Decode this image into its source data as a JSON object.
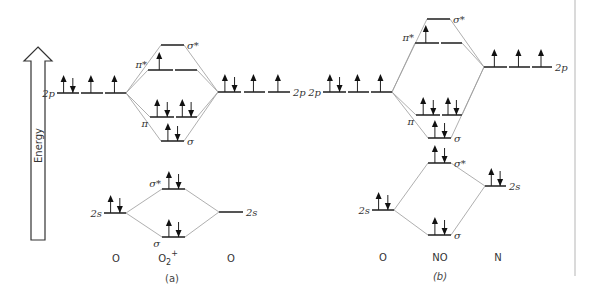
{
  "energy_axis": {
    "label": "Energy",
    "arrow": {
      "x": 38,
      "top": 47,
      "bottom": 240,
      "shaft_half": 7,
      "head_half": 14,
      "head_h": 14
    }
  },
  "divider": {
    "x": 575,
    "y1": 0,
    "y2": 276
  },
  "panels": [
    {
      "id": "a",
      "caption": "(a)",
      "caption_pos": [
        172,
        282
      ],
      "species": [
        {
          "text": "O",
          "x": 116,
          "y": 262
        },
        {
          "text": "O",
          "sub": "2",
          "sup": "+",
          "x": 168,
          "y": 262
        },
        {
          "text": "O",
          "x": 231,
          "y": 262
        }
      ],
      "levels": [
        {
          "name": "left-2p",
          "segments": [
            [
              57,
              79
            ],
            [
              81,
              103
            ],
            [
              105,
              126
            ]
          ],
          "y": 93,
          "electrons": [
            [
              "up",
              "down"
            ],
            [
              "up"
            ],
            [
              "up"
            ]
          ],
          "label": "2p",
          "label_side": "left"
        },
        {
          "name": "right-2p",
          "segments": [
            [
              218,
              241
            ],
            [
              244,
              265
            ],
            [
              268,
              290
            ]
          ],
          "y": 92,
          "electrons": [
            [
              "up",
              "down"
            ],
            [
              "up"
            ],
            [
              "up"
            ]
          ],
          "label": "2p",
          "label_side": "right"
        },
        {
          "name": "sigma-star-2p",
          "segments": [
            [
              161,
              184
            ]
          ],
          "y": 45,
          "electrons": [
            []
          ],
          "label": "σ*",
          "label_side": "right"
        },
        {
          "name": "pi-star-2p",
          "segments": [
            [
              148,
              173
            ],
            [
              175,
              197
            ]
          ],
          "y": 70,
          "electrons": [
            [
              "up"
            ],
            []
          ],
          "label": "π*",
          "label_side": "left-above"
        },
        {
          "name": "pi-2p",
          "segments": [
            [
              150,
              174
            ],
            [
              176,
              197
            ]
          ],
          "y": 117,
          "electrons": [
            [
              "up",
              "down"
            ],
            [
              "up",
              "down"
            ]
          ],
          "label": "π",
          "label_side": "left-below"
        },
        {
          "name": "sigma-2p",
          "segments": [
            [
              161,
              184
            ]
          ],
          "y": 141,
          "electrons": [
            [
              "up",
              "down"
            ]
          ],
          "label": "σ",
          "label_side": "right"
        },
        {
          "name": "left-2s",
          "segments": [
            [
              104,
              126
            ]
          ],
          "y": 213,
          "electrons": [
            [
              "up",
              "down"
            ]
          ],
          "label": "2s",
          "label_side": "left"
        },
        {
          "name": "right-2s",
          "segments": [
            [
              219,
              243
            ]
          ],
          "y": 212,
          "electrons": [
            []
          ],
          "label": "2s",
          "label_side": "right"
        },
        {
          "name": "sigma-star-2s",
          "segments": [
            [
              162,
              185
            ]
          ],
          "y": 189,
          "electrons": [
            [
              "up",
              "down"
            ]
          ],
          "label": "σ*",
          "label_side": "left-above"
        },
        {
          "name": "sigma-2s",
          "segments": [
            [
              162,
              185
            ]
          ],
          "y": 237,
          "electrons": [
            [
              "up",
              "down"
            ]
          ],
          "label": "σ",
          "label_side": "left-below"
        }
      ],
      "correlations": [
        [
          [
            126,
            93
          ],
          [
            148,
            70
          ]
        ],
        [
          [
            126,
            93
          ],
          [
            161,
            45
          ]
        ],
        [
          [
            126,
            93
          ],
          [
            150,
            117
          ]
        ],
        [
          [
            126,
            93
          ],
          [
            161,
            141
          ]
        ],
        [
          [
            218,
            92
          ],
          [
            197,
            70
          ]
        ],
        [
          [
            218,
            92
          ],
          [
            184,
            45
          ]
        ],
        [
          [
            218,
            92
          ],
          [
            197,
            117
          ]
        ],
        [
          [
            218,
            92
          ],
          [
            184,
            141
          ]
        ],
        [
          [
            126,
            213
          ],
          [
            162,
            189
          ]
        ],
        [
          [
            126,
            213
          ],
          [
            162,
            237
          ]
        ],
        [
          [
            219,
            212
          ],
          [
            185,
            189
          ]
        ],
        [
          [
            219,
            212
          ],
          [
            185,
            237
          ]
        ]
      ]
    },
    {
      "id": "b",
      "caption": "(b)",
      "caption_pos": [
        440,
        280
      ],
      "species": [
        {
          "text": "O",
          "x": 383,
          "y": 261
        },
        {
          "text": "NO",
          "x": 440,
          "y": 261
        },
        {
          "text": "N",
          "x": 498,
          "y": 261
        }
      ],
      "levels": [
        {
          "name": "O-2p",
          "segments": [
            [
              323,
              346
            ],
            [
              348,
              369
            ],
            [
              371,
              392
            ]
          ],
          "y": 92,
          "electrons": [
            [
              "up",
              "down"
            ],
            [
              "up"
            ],
            [
              "up"
            ]
          ],
          "label": "2p",
          "label_side": "left"
        },
        {
          "name": "N-2p",
          "segments": [
            [
              484,
              507
            ],
            [
              509,
              530
            ],
            [
              532,
              552
            ]
          ],
          "y": 67,
          "electrons": [
            [
              "up"
            ],
            [
              "up"
            ],
            [
              "up"
            ]
          ],
          "label": "2p",
          "label_side": "right"
        },
        {
          "name": "sigma-star-2p",
          "segments": [
            [
              427,
              450
            ]
          ],
          "y": 19,
          "electrons": [
            []
          ],
          "label": "σ*",
          "label_side": "right"
        },
        {
          "name": "pi-star-2p",
          "segments": [
            [
              415,
              439
            ],
            [
              441,
              462
            ]
          ],
          "y": 43,
          "electrons": [
            [
              "up"
            ],
            []
          ],
          "label": "π*",
          "label_side": "left-above"
        },
        {
          "name": "pi-2p",
          "segments": [
            [
              416,
              440
            ],
            [
              442,
              462
            ]
          ],
          "y": 115,
          "electrons": [
            [
              "up",
              "down"
            ],
            [
              "up",
              "down"
            ]
          ],
          "label": "π",
          "label_side": "left-below"
        },
        {
          "name": "sigma-2p",
          "segments": [
            [
              428,
              451
            ]
          ],
          "y": 138,
          "electrons": [
            [
              "up",
              "down"
            ]
          ],
          "label": "σ",
          "label_side": "right"
        },
        {
          "name": "sigma-star-2s",
          "segments": [
            [
              428,
              451
            ]
          ],
          "y": 163,
          "electrons": [
            [
              "up",
              "down"
            ]
          ],
          "label": "σ*",
          "label_side": "right"
        },
        {
          "name": "N-2s",
          "segments": [
            [
              485,
              506
            ]
          ],
          "y": 186,
          "electrons": [
            [
              "up",
              "down"
            ]
          ],
          "label": "2s",
          "label_side": "right"
        },
        {
          "name": "O-2s",
          "segments": [
            [
              372,
              394
            ]
          ],
          "y": 210,
          "electrons": [
            [
              "up",
              "down"
            ]
          ],
          "label": "2s",
          "label_side": "left"
        },
        {
          "name": "sigma-2s",
          "segments": [
            [
              428,
              451
            ]
          ],
          "y": 235,
          "electrons": [
            [
              "up",
              "down"
            ]
          ],
          "label": "σ",
          "label_side": "right"
        }
      ],
      "correlations": [
        [
          [
            392,
            92
          ],
          [
            427,
            19
          ]
        ],
        [
          [
            392,
            92
          ],
          [
            416,
            115
          ]
        ],
        [
          [
            392,
            92
          ],
          [
            428,
            138
          ]
        ],
        [
          [
            484,
            67
          ],
          [
            462,
            43
          ]
        ],
        [
          [
            484,
            67
          ],
          [
            450,
            19
          ]
        ],
        [
          [
            484,
            67
          ],
          [
            462,
            115
          ]
        ],
        [
          [
            484,
            67
          ],
          [
            451,
            138
          ]
        ],
        [
          [
            392,
            92
          ],
          [
            415,
            43
          ]
        ],
        [
          [
            394,
            210
          ],
          [
            428,
            163
          ]
        ],
        [
          [
            394,
            210
          ],
          [
            428,
            235
          ]
        ],
        [
          [
            485,
            186
          ],
          [
            451,
            163
          ]
        ],
        [
          [
            485,
            186
          ],
          [
            451,
            235
          ]
        ]
      ]
    }
  ],
  "colors": {
    "level": "#555555",
    "correlation": "#9a9a9a",
    "electron": "#111111",
    "text": "#333333"
  }
}
